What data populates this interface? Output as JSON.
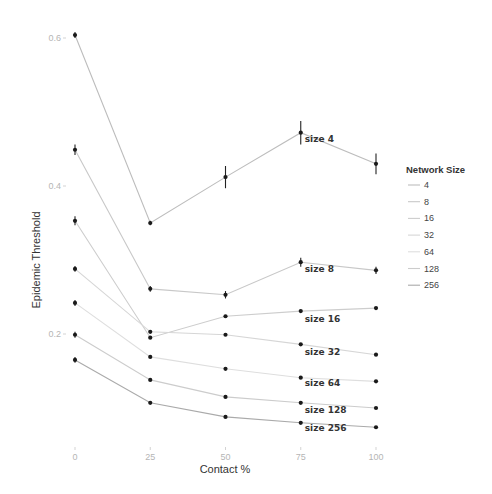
{
  "chart_data": {
    "type": "line",
    "title": "",
    "xlabel": "Contact %",
    "ylabel": "Epidemic Threshold",
    "x": [
      0,
      25,
      50,
      75,
      100
    ],
    "x_ticks": [
      "0",
      "25",
      "50",
      "75",
      "100"
    ],
    "y_ticks": [
      {
        "value": 0.2,
        "label": "0.2"
      },
      {
        "value": 0.4,
        "label": "0.4"
      },
      {
        "value": 0.6,
        "label": "0.6"
      }
    ],
    "xlim": [
      0,
      100
    ],
    "ylim": [
      0.05,
      0.63
    ],
    "grid": false,
    "legend": {
      "title": "Network Size",
      "position": "right"
    },
    "series": [
      {
        "name": "4",
        "label": "size 4",
        "color": "#bdbdbd",
        "values": [
          0.604,
          0.35,
          0.412,
          0.472,
          0.43
        ],
        "errors": [
          0.004,
          0.003,
          0.015,
          0.016,
          0.014
        ]
      },
      {
        "name": "8",
        "label": "size 8",
        "color": "#c8c8c8",
        "values": [
          0.449,
          0.261,
          0.253,
          0.297,
          0.286
        ],
        "errors": [
          0.007,
          0.004,
          0.005,
          0.006,
          0.005
        ]
      },
      {
        "name": "16",
        "label": "size 16",
        "color": "#cdcdcd",
        "values": [
          0.353,
          0.195,
          0.224,
          0.231,
          0.235
        ],
        "errors": [
          0.006,
          0.002,
          0.002,
          0.002,
          0.002
        ]
      },
      {
        "name": "32",
        "label": "size 32",
        "color": "#d6d6d6",
        "values": [
          0.288,
          0.203,
          0.199,
          0.186,
          0.172
        ],
        "errors": [
          0.004,
          0.002,
          0.002,
          0.002,
          0.002
        ]
      },
      {
        "name": "64",
        "label": "size 64",
        "color": "#dedede",
        "values": [
          0.242,
          0.169,
          0.153,
          0.141,
          0.136
        ],
        "errors": [
          0.004,
          0.002,
          0.002,
          0.002,
          0.002
        ]
      },
      {
        "name": "128",
        "label": "size 128",
        "color": "#cccccc",
        "values": [
          0.199,
          0.138,
          0.115,
          0.107,
          0.1
        ],
        "errors": [
          0.004,
          0.002,
          0.002,
          0.002,
          0.002
        ]
      },
      {
        "name": "256",
        "label": "size 256",
        "color": "#aaaaaa",
        "values": [
          0.165,
          0.107,
          0.088,
          0.08,
          0.074
        ],
        "errors": [
          0.004,
          0.002,
          0.002,
          0.002,
          0.002
        ]
      }
    ]
  }
}
